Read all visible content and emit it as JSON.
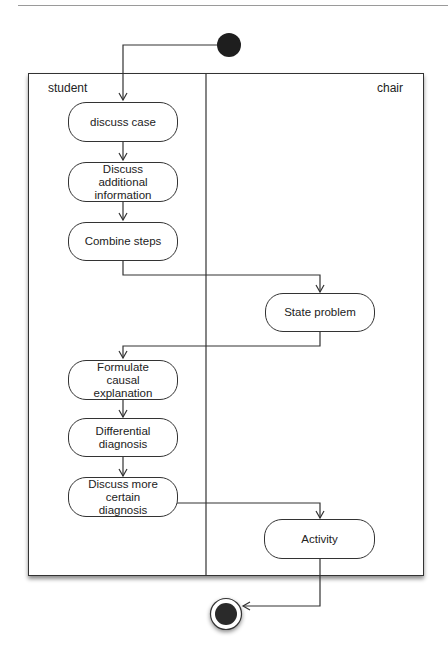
{
  "diagram": {
    "type": "UML activity diagram with swimlanes",
    "lanes": [
      {
        "id": "student",
        "label": "student"
      },
      {
        "id": "chair",
        "label": "chair"
      }
    ],
    "nodes": [
      {
        "id": "start",
        "kind": "initial"
      },
      {
        "id": "n1",
        "lane": "student",
        "label": "discuss case"
      },
      {
        "id": "n2",
        "lane": "student",
        "label": "Discuss additional information"
      },
      {
        "id": "n3",
        "lane": "student",
        "label": "Combine steps"
      },
      {
        "id": "n4",
        "lane": "chair",
        "label": "State problem"
      },
      {
        "id": "n5",
        "lane": "student",
        "label": "Formulate causal explanation"
      },
      {
        "id": "n6",
        "lane": "student",
        "label": "Differential diagnosis"
      },
      {
        "id": "n7",
        "lane": "student",
        "label": "Discuss more certain diagnosis"
      },
      {
        "id": "n8",
        "lane": "chair",
        "label": "Activity"
      },
      {
        "id": "end",
        "kind": "final"
      }
    ],
    "edges": [
      [
        "start",
        "n1"
      ],
      [
        "n1",
        "n2"
      ],
      [
        "n2",
        "n3"
      ],
      [
        "n3",
        "n4"
      ],
      [
        "n4",
        "n5"
      ],
      [
        "n5",
        "n6"
      ],
      [
        "n6",
        "n7"
      ],
      [
        "n7",
        "n8"
      ],
      [
        "n8",
        "end"
      ]
    ]
  }
}
